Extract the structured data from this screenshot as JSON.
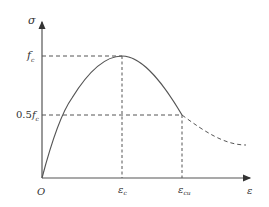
{
  "diagram": {
    "type": "stress-strain curve (concrete)",
    "axes": {
      "y_label": "σ",
      "x_label": "ε",
      "origin_label": "O"
    },
    "y_ticks": [
      {
        "label_main": "f",
        "label_sub": "c",
        "meaning": "peak stress"
      },
      {
        "label_prefix": "0.5",
        "label_main": "f",
        "label_sub": "c",
        "meaning": "half peak stress"
      }
    ],
    "x_ticks": [
      {
        "label_main": "ε",
        "label_sub": "c",
        "meaning": "strain at peak stress"
      },
      {
        "label_main": "ε",
        "label_sub": "cu",
        "meaning": "ultimate strain"
      }
    ],
    "curves": [
      {
        "name": "ascending-and-softening-branch",
        "style": "solid",
        "from": "O",
        "through": "(ε_c, f_c)",
        "to": "(ε_cu, 0.5f_c)"
      },
      {
        "name": "post-ultimate-tail",
        "style": "dashed",
        "from": "(ε_cu, 0.5f_c)",
        "trend": "decreasing, flattening"
      }
    ],
    "guides": [
      {
        "name": "fc-horizontal",
        "style": "dashed"
      },
      {
        "name": "half-fc-horizontal",
        "style": "dashed"
      },
      {
        "name": "eps-c-vertical",
        "style": "dashed"
      },
      {
        "name": "eps-cu-vertical",
        "style": "dashed"
      }
    ],
    "colors": {
      "line": "#555555",
      "text": "#333333",
      "background": "#ffffff"
    }
  }
}
